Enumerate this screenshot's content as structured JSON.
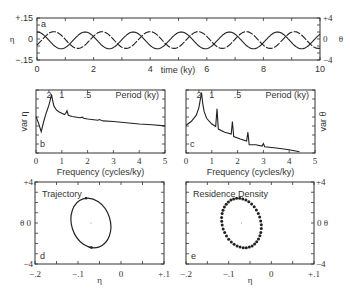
{
  "chart_data": [
    {
      "id": "a",
      "type": "line",
      "panel_label": "a",
      "xlabel": "time (ky)",
      "ylabel_left": "η",
      "ylabel_right": "θ",
      "xlim": [
        0,
        10
      ],
      "ylim_left": [
        -0.15,
        0.15
      ],
      "ylim_right": [
        -4,
        4
      ],
      "xticks": [
        "0",
        "2",
        "4",
        "6",
        "8",
        "10"
      ],
      "yticks_left": [
        "-.15",
        "0",
        "+.15"
      ],
      "yticks_right": [
        "-4",
        "0",
        "+4"
      ],
      "series": [
        {
          "name": "η",
          "axis": "left",
          "period": 1.7,
          "amplitude": 0.06,
          "phase": 0.0,
          "offset": -0.01
        },
        {
          "name": "θ",
          "axis": "right",
          "period": 1.7,
          "amplitude": 1.6,
          "phase": 0.35,
          "offset": -0.2
        }
      ]
    },
    {
      "id": "b",
      "type": "line",
      "panel_label": "b",
      "xlabel": "Frequency (cycles/ky)",
      "ylabel": "var η",
      "top_axis_label": "Period (ky)",
      "top_ticks": [
        {
          "label": "2",
          "freq": 0.5
        },
        {
          "label": "1",
          "freq": 1.0
        },
        {
          "label": ".5",
          "freq": 2.0
        }
      ],
      "xlim": [
        0,
        5
      ],
      "ylim": [
        0,
        1
      ],
      "xticks": [
        "0",
        "1",
        "2",
        "3",
        "4",
        "5"
      ],
      "x": [
        0,
        0.1,
        0.2,
        0.3,
        0.4,
        0.5,
        0.55,
        0.6,
        0.65,
        0.7,
        0.8,
        0.9,
        1.0,
        1.1,
        1.15,
        1.2,
        1.25,
        1.4,
        1.7,
        1.8,
        1.85,
        2.0,
        2.4,
        2.45,
        2.6,
        3.0,
        3.5,
        4.0,
        4.5,
        5.0
      ],
      "values": [
        0.58,
        0.47,
        0.34,
        0.5,
        0.64,
        0.76,
        0.84,
        0.93,
        0.82,
        0.74,
        0.68,
        0.65,
        0.63,
        0.61,
        0.63,
        0.67,
        0.6,
        0.58,
        0.56,
        0.57,
        0.55,
        0.54,
        0.52,
        0.53,
        0.51,
        0.5,
        0.48,
        0.46,
        0.45,
        0.43
      ]
    },
    {
      "id": "c",
      "type": "line",
      "panel_label": "c",
      "xlabel": "Frequency (cycles/ky)",
      "ylabel": "var θ",
      "top_axis_label": "Period (ky)",
      "top_ticks": [
        {
          "label": "2",
          "freq": 0.5
        },
        {
          "label": "1",
          "freq": 1.0
        },
        {
          "label": ".5",
          "freq": 2.0
        }
      ],
      "xlim": [
        0,
        5
      ],
      "ylim": [
        0,
        1
      ],
      "xticks": [
        "0",
        "1",
        "2",
        "3",
        "4",
        "5"
      ],
      "x": [
        0,
        0.2,
        0.4,
        0.5,
        0.55,
        0.6,
        0.65,
        0.7,
        0.8,
        1.0,
        1.15,
        1.2,
        1.25,
        1.5,
        1.75,
        1.8,
        1.85,
        2.1,
        2.35,
        2.4,
        2.45,
        2.7,
        2.95,
        3.0,
        3.05,
        3.5,
        4.0,
        4.4
      ],
      "values": [
        0.44,
        0.5,
        0.6,
        0.72,
        0.84,
        0.96,
        0.78,
        0.66,
        0.55,
        0.46,
        0.42,
        0.7,
        0.38,
        0.33,
        0.3,
        0.5,
        0.26,
        0.22,
        0.19,
        0.33,
        0.13,
        0.13,
        0.11,
        0.15,
        0.1,
        0.08,
        0.05,
        0.02
      ]
    },
    {
      "id": "d",
      "type": "line",
      "panel_label": "d",
      "title": "Trajectory",
      "xlabel": "η",
      "ylabel": "θ",
      "xlim": [
        -0.2,
        0.1
      ],
      "ylim": [
        -4,
        4
      ],
      "xticks": [
        "-.2",
        "-.1",
        "0",
        "+.1"
      ],
      "yticks": [
        "-4",
        "0",
        "+4"
      ],
      "ellipse": {
        "cx": -0.07,
        "cy": 0.0,
        "rx": 0.045,
        "ry": 0.95,
        "tilt_deg": 18
      }
    },
    {
      "id": "e",
      "type": "scatter",
      "panel_label": "e",
      "title": "Residence Density",
      "xlabel": "η",
      "ylabel": "θ",
      "xlim": [
        -0.2,
        0.1
      ],
      "ylim": [
        -4,
        4
      ],
      "xticks": [
        "-.2",
        "-.1",
        "0",
        "+.1"
      ],
      "yticks": [
        "-4",
        "0",
        "+4"
      ],
      "ellipse": {
        "cx": -0.07,
        "cy": 0.0,
        "rx": 0.045,
        "ry": 0.95,
        "tilt_deg": 18,
        "n_points": 40
      }
    }
  ]
}
